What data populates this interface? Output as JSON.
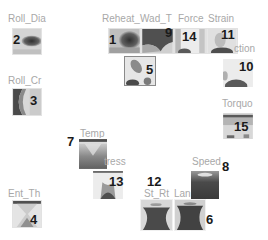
{
  "components": [
    {
      "id": 1,
      "label": "Reheat_",
      "pattern": "blob-right-dark"
    },
    {
      "id": 2,
      "label": "Roll_Dia",
      "pattern": "band-right-dark"
    },
    {
      "id": 3,
      "label": "Roll_Cr",
      "pattern": "arc-left-dark"
    },
    {
      "id": 4,
      "label": "Ent_Th",
      "pattern": "hourglass-light"
    },
    {
      "id": 5,
      "label": "",
      "pattern": "diagonal-blob"
    },
    {
      "id": 6,
      "label": "Lan",
      "pattern": "hourglass-dark"
    },
    {
      "id": 7,
      "label": "Temp",
      "pattern": "hourglass-medium"
    },
    {
      "id": 8,
      "label": "Speed",
      "pattern": "hourglass-dark"
    },
    {
      "id": 9,
      "label": "Wad_T",
      "pattern": "top-dark"
    },
    {
      "id": 10,
      "label": "ction",
      "pattern": "bottom-peak"
    },
    {
      "id": 11,
      "label": "Strain",
      "pattern": "bottom-peak"
    },
    {
      "id": 12,
      "label": "St_Rt",
      "pattern": "hourglass-dark"
    },
    {
      "id": 13,
      "label": "tress",
      "pattern": "hourglass-medium"
    },
    {
      "id": 14,
      "label": "Force",
      "pattern": "bottom-peak-light"
    },
    {
      "id": 15,
      "label": "Torquo",
      "pattern": "top-stripe"
    }
  ],
  "labels": {
    "c1": "Reheat_",
    "c2": "Roll_Dia",
    "c3": "Roll_Cr",
    "c4": "Ent_Th",
    "c6": "Lan",
    "c7": "Temp",
    "c8": "Speed",
    "c9": "Wad_T",
    "c10": "ction",
    "c11": "Strain",
    "c12": "St_Rt",
    "c13": "tress",
    "c14": "Force",
    "c15": "Torquo"
  },
  "numbers": {
    "n1": "1",
    "n2": "2",
    "n3": "3",
    "n4": "4",
    "n5": "5",
    "n6": "6",
    "n7": "7",
    "n8": "8",
    "n9": "9",
    "n10": "10",
    "n11": "11",
    "n12": "12",
    "n13": "13",
    "n14": "14",
    "n15": "15"
  },
  "colors": {
    "background": "#ffffff",
    "label": "#a8a8a8",
    "number": "#1a1a1a",
    "dark": "#3a3a3a",
    "light": "#e8e8e8"
  }
}
